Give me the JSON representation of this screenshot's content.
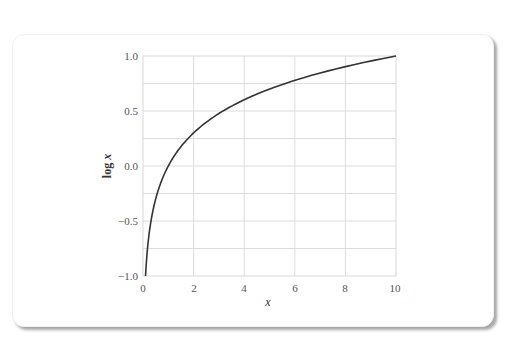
{
  "chart_data": {
    "type": "line",
    "title": "",
    "xlabel": "x",
    "ylabel": "log x",
    "xlim": [
      0,
      10
    ],
    "ylim": [
      -1.0,
      1.0
    ],
    "grid": true,
    "legend": null,
    "x_ticks": [
      "0",
      "2",
      "4",
      "6",
      "8",
      "10"
    ],
    "y_ticks": [
      "-1.0",
      "-0.5",
      "0.0",
      "0.5",
      "1.0"
    ],
    "series": [
      {
        "name": "log x",
        "function": "log10(x)",
        "color": "#333333",
        "x": [
          0.1,
          0.2,
          0.3,
          0.5,
          0.75,
          1,
          1.5,
          2,
          3,
          4,
          5,
          6,
          7,
          8,
          9,
          10
        ],
        "y": [
          -1.0,
          -0.699,
          -0.523,
          -0.301,
          -0.125,
          0.0,
          0.176,
          0.301,
          0.477,
          0.602,
          0.699,
          0.778,
          0.845,
          0.903,
          0.954,
          1.0
        ]
      }
    ]
  },
  "labels": {
    "x_axis": "x",
    "y_axis_log": "log ",
    "y_axis_var": "x",
    "x_ticks": [
      "0",
      "2",
      "4",
      "6",
      "8",
      "10"
    ],
    "y_ticks": [
      "1.0",
      "0.5",
      "0.0",
      "−0.5",
      "−1.0"
    ]
  },
  "colors": {
    "curve": "#333333",
    "grid": "#dddddd",
    "frame": "#d8d8d8",
    "tick_text": "#555555"
  }
}
